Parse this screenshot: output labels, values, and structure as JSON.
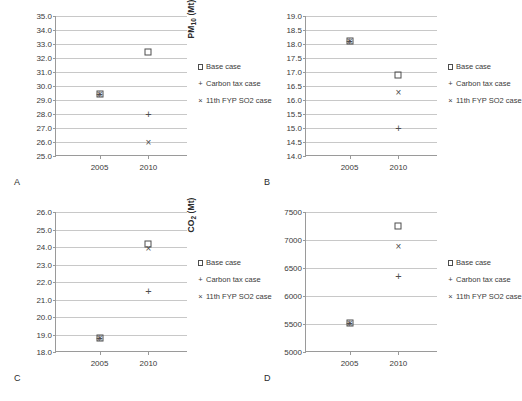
{
  "legend": {
    "items": [
      {
        "key": "square",
        "label": "Base case"
      },
      {
        "key": "plus",
        "label": "Carbon tax case"
      },
      {
        "key": "cross",
        "label": "11th FYP SO2 case"
      }
    ]
  },
  "panels": [
    {
      "letter": "A",
      "ylabel_html": "SO<sub>2</sub> (Mt)"
    },
    {
      "letter": "B",
      "ylabel_html": "PM<sub>10</sub> (Mt)"
    },
    {
      "letter": "C",
      "ylabel_html": "NO<sub>x</sub> (Mt)"
    },
    {
      "letter": "D",
      "ylabel_html": "CO<sub>2</sub> (Mt)"
    }
  ],
  "chart_data": [
    {
      "type": "scatter",
      "panel": "A",
      "title": "",
      "xlabel": "",
      "ylabel": "SO2 (Mt)",
      "categories": [
        "2005",
        "2010"
      ],
      "x": [
        2005,
        2010
      ],
      "ylim": [
        25.0,
        35.0
      ],
      "ytick_step": 1.0,
      "yticks": [
        25.0,
        26.0,
        27.0,
        28.0,
        29.0,
        30.0,
        31.0,
        32.0,
        33.0,
        34.0,
        35.0
      ],
      "ytick_labels": [
        "25.0",
        "26.0",
        "27.0",
        "28.0",
        "29.0",
        "30.0",
        "31.0",
        "32.0",
        "33.0",
        "34.0",
        "35.0"
      ],
      "grid": true,
      "legend_position": "right",
      "series": [
        {
          "name": "Base case",
          "marker": "square",
          "values": [
            29.4,
            32.4
          ]
        },
        {
          "name": "Carbon tax case",
          "marker": "plus",
          "values": [
            29.4,
            28.0
          ]
        },
        {
          "name": "11th FYP SO2 case",
          "marker": "cross",
          "values": [
            29.4,
            26.0
          ]
        }
      ]
    },
    {
      "type": "scatter",
      "panel": "B",
      "title": "",
      "xlabel": "",
      "ylabel": "PM10 (Mt)",
      "categories": [
        "2005",
        "2010"
      ],
      "x": [
        2005,
        2010
      ],
      "ylim": [
        14.0,
        19.0
      ],
      "ytick_step": 0.5,
      "yticks": [
        14.0,
        14.5,
        15.0,
        15.5,
        16.0,
        16.5,
        17.0,
        17.5,
        18.0,
        18.5,
        19.0
      ],
      "ytick_labels": [
        "14.0",
        "14.5",
        "15.0",
        "15.5",
        "16.0",
        "16.5",
        "17.0",
        "17.5",
        "18.0",
        "18.5",
        "19.0"
      ],
      "grid": true,
      "legend_position": "right",
      "series": [
        {
          "name": "Base case",
          "marker": "square",
          "values": [
            18.1,
            16.9
          ]
        },
        {
          "name": "Carbon tax case",
          "marker": "plus",
          "values": [
            18.1,
            15.0
          ]
        },
        {
          "name": "11th FYP SO2 case",
          "marker": "cross",
          "values": [
            18.1,
            16.3
          ]
        }
      ]
    },
    {
      "type": "scatter",
      "panel": "C",
      "title": "",
      "xlabel": "",
      "ylabel": "NOx (Mt)",
      "categories": [
        "2005",
        "2010"
      ],
      "x": [
        2005,
        2010
      ],
      "ylim": [
        18.0,
        26.0
      ],
      "ytick_step": 1.0,
      "yticks": [
        18.0,
        19.0,
        20.0,
        21.0,
        22.0,
        23.0,
        24.0,
        25.0,
        26.0
      ],
      "ytick_labels": [
        "18.0",
        "19.0",
        "20.0",
        "21.0",
        "22.0",
        "23.0",
        "24.0",
        "25.0",
        "26.0"
      ],
      "grid": true,
      "legend_position": "right",
      "series": [
        {
          "name": "Base case",
          "marker": "square",
          "values": [
            18.8,
            24.2
          ]
        },
        {
          "name": "Carbon tax case",
          "marker": "plus",
          "values": [
            18.8,
            21.5
          ]
        },
        {
          "name": "11th FYP SO2 case",
          "marker": "cross",
          "values": [
            18.8,
            23.95
          ]
        }
      ]
    },
    {
      "type": "scatter",
      "panel": "D",
      "title": "",
      "xlabel": "",
      "ylabel": "CO2 (Mt)",
      "categories": [
        "2005",
        "2010"
      ],
      "x": [
        2005,
        2010
      ],
      "ylim": [
        5000,
        7500
      ],
      "ytick_step": 500,
      "yticks": [
        5000,
        5500,
        6000,
        6500,
        7000,
        7500
      ],
      "ytick_labels": [
        "5000",
        "5500",
        "6000",
        "6500",
        "7000",
        "7500"
      ],
      "grid": true,
      "legend_position": "right",
      "series": [
        {
          "name": "Base case",
          "marker": "square",
          "values": [
            5520,
            7250
          ]
        },
        {
          "name": "Carbon tax case",
          "marker": "plus",
          "values": [
            5520,
            6360
          ]
        },
        {
          "name": "11th FYP SO2 case",
          "marker": "cross",
          "values": [
            5520,
            6900
          ]
        }
      ]
    }
  ]
}
